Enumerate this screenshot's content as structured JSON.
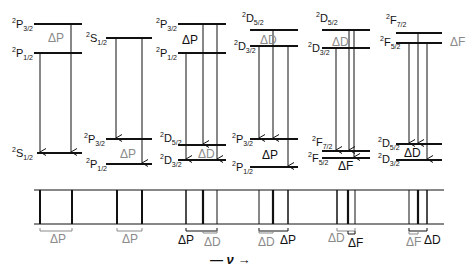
{
  "colors": {
    "line": "#111111",
    "gray": "#8a8a8a"
  },
  "columns": [
    {
      "upper": [
        {
          "term": "P",
          "j": "3/2"
        },
        {
          "term": "P",
          "j": "1/2"
        }
      ],
      "upper_delta": "ΔP",
      "upper_delta_gray": true,
      "lower": [
        {
          "term": "S",
          "j": "1/2"
        }
      ],
      "lower_delta": "",
      "spectrum_label": "ΔP"
    },
    {
      "upper": [
        {
          "term": "S",
          "j": "1/2"
        }
      ],
      "upper_delta": "",
      "lower": [
        {
          "term": "P",
          "j": "3/2"
        },
        {
          "term": "P",
          "j": "1/2"
        }
      ],
      "lower_delta": "ΔP",
      "lower_delta_gray": true,
      "spectrum_label": "ΔP"
    },
    {
      "upper": [
        {
          "term": "P",
          "j": "3/2"
        },
        {
          "term": "P",
          "j": "1/2"
        }
      ],
      "upper_delta": "ΔP",
      "lower": [
        {
          "term": "D",
          "j": "5/2"
        },
        {
          "term": "D",
          "j": "3/2"
        }
      ],
      "lower_delta": "ΔD",
      "lower_delta_gray": true,
      "spectrum_labels": [
        "ΔP",
        "ΔD"
      ]
    },
    {
      "upper": [
        {
          "term": "D",
          "j": "5/2"
        },
        {
          "term": "D",
          "j": "3/2"
        }
      ],
      "upper_delta": "ΔD",
      "upper_delta_gray": true,
      "lower": [
        {
          "term": "P",
          "j": "3/2"
        },
        {
          "term": "P",
          "j": "1/2"
        }
      ],
      "lower_delta": "ΔP",
      "spectrum_labels": [
        "ΔD",
        "ΔP"
      ]
    },
    {
      "upper": [
        {
          "term": "D",
          "j": "5/2"
        },
        {
          "term": "D",
          "j": "3/2"
        }
      ],
      "upper_delta": "ΔD",
      "upper_delta_gray": true,
      "lower": [
        {
          "term": "F",
          "j": "7/2"
        },
        {
          "term": "F",
          "j": "5/2"
        }
      ],
      "lower_delta": "ΔF",
      "spectrum_labels": [
        "ΔD",
        "ΔF"
      ]
    },
    {
      "upper": [
        {
          "term": "F",
          "j": "7/2"
        },
        {
          "term": "F",
          "j": "5/2"
        }
      ],
      "upper_delta": "ΔF",
      "upper_delta_gray": true,
      "lower": [
        {
          "term": "D",
          "j": "5/2"
        },
        {
          "term": "D",
          "j": "3/2"
        }
      ],
      "lower_delta": "ΔD",
      "spectrum_labels": [
        "ΔF",
        "ΔD"
      ]
    }
  ],
  "axis_label": "— ν →",
  "multiplicity": "2"
}
